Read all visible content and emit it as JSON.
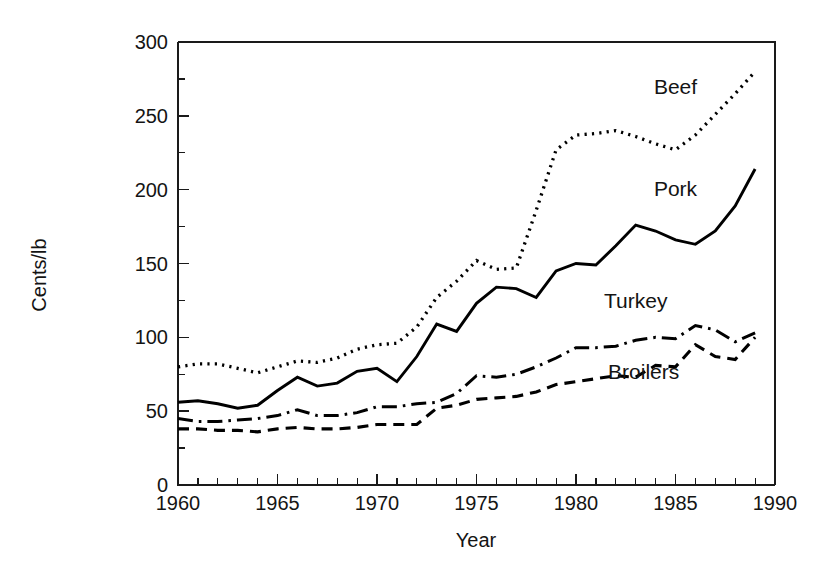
{
  "chart_data": {
    "type": "line",
    "title": "",
    "xlabel": "Year",
    "ylabel": "Cents/lb",
    "xlim": [
      1960,
      1990
    ],
    "ylim": [
      0,
      300
    ],
    "grid": false,
    "legend_position": "inline-annotations",
    "x_major_ticks": [
      1960,
      1965,
      1970,
      1975,
      1980,
      1985,
      1990
    ],
    "x_major_tick_labels": [
      "1960",
      "1965",
      "1970",
      "1975",
      "1980",
      "1985",
      "1990"
    ],
    "x_minor_tick_step": 1,
    "y_major_ticks": [
      0,
      50,
      100,
      150,
      200,
      250,
      300
    ],
    "y_major_tick_labels": [
      "0",
      "50",
      "100",
      "150",
      "200",
      "250",
      "300"
    ],
    "y_minor_ticks": [
      25,
      75,
      125,
      175,
      225,
      275
    ],
    "x": [
      1960,
      1961,
      1962,
      1963,
      1964,
      1965,
      1966,
      1967,
      1968,
      1969,
      1970,
      1971,
      1972,
      1973,
      1974,
      1975,
      1976,
      1977,
      1978,
      1979,
      1980,
      1981,
      1982,
      1983,
      1984,
      1985,
      1986,
      1987,
      1988,
      1989
    ],
    "series": [
      {
        "name": "Beef",
        "style": "dotted",
        "color": "#000000",
        "label": "Beef",
        "values": [
          80,
          82,
          82,
          79,
          76,
          80,
          84,
          83,
          86,
          92,
          95,
          96,
          107,
          127,
          138,
          152,
          146,
          147,
          186,
          227,
          237,
          238,
          240,
          236,
          231,
          227,
          237,
          251,
          265,
          280
        ]
      },
      {
        "name": "Pork",
        "style": "solid",
        "color": "#000000",
        "label": "Pork",
        "values": [
          56,
          57,
          55,
          52,
          54,
          64,
          73,
          67,
          69,
          77,
          79,
          70,
          87,
          109,
          104,
          123,
          134,
          133,
          127,
          145,
          150,
          149,
          162,
          176,
          172,
          166,
          163,
          172,
          189,
          214
        ]
      },
      {
        "name": "Turkey",
        "style": "dashdot",
        "color": "#000000",
        "label": "Turkey",
        "values": [
          45,
          43,
          43,
          44,
          45,
          47,
          51,
          47,
          47,
          49,
          53,
          53,
          55,
          56,
          62,
          74,
          73,
          75,
          80,
          86,
          93,
          93,
          94,
          98,
          100,
          99,
          108,
          105,
          97,
          103
        ]
      },
      {
        "name": "Broilers",
        "style": "dashed",
        "color": "#000000",
        "label": "Broilers",
        "values": [
          38,
          38,
          37,
          37,
          36,
          38,
          39,
          38,
          38,
          39,
          41,
          41,
          41,
          52,
          54,
          58,
          59,
          60,
          63,
          68,
          70,
          72,
          74,
          73,
          81,
          80,
          95,
          87,
          85,
          100
        ]
      }
    ],
    "annotations": [
      {
        "text": "Beef",
        "x": 1985.0,
        "y": 265
      },
      {
        "text": "Pork",
        "x": 1985.0,
        "y": 196
      },
      {
        "text": "Turkey",
        "x": 1983.0,
        "y": 120
      },
      {
        "text": "Broilers",
        "x": 1983.4,
        "y": 72
      }
    ]
  },
  "axes": {
    "x_title": "Year",
    "y_title": "Cents/lb"
  }
}
